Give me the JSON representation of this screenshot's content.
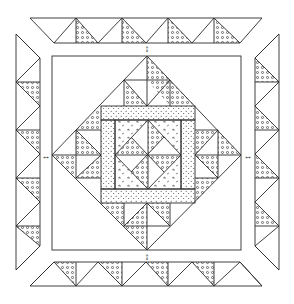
{
  "figure": {
    "type": "quilt-pattern-diagram",
    "colors": {
      "line": "#2a2a2a",
      "background": "#ffffff",
      "dot": "#3a3a3a"
    },
    "markers": {
      "join_arrows": [
        "top",
        "bottom",
        "left",
        "right"
      ],
      "arrow_glyph_vertical": "↕",
      "arrow_glyph_horizontal": "↔"
    },
    "borders": {
      "top": {
        "triangle_units": 4
      },
      "bottom": {
        "triangle_units": 4
      },
      "left": {
        "triangle_units": 4
      },
      "right": {
        "triangle_units": 4
      }
    },
    "center": {
      "outer_square": "plain",
      "diamond": "on-point with half-square triangle units",
      "frame": "dotted strips",
      "core": "four-patch of quarter-square triangles"
    }
  },
  "caption": {
    "text": ""
  }
}
